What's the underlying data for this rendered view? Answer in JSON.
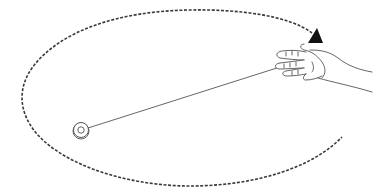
{
  "diagram": {
    "colors": {
      "background": "#ffffff",
      "stroke": "#444444",
      "orbit": "#3a3a3a",
      "arrow": "#111111"
    },
    "elements": {
      "orbit_path": "dashed-elliptical-path",
      "direction_arrow": "triangle-arrow",
      "string": "yoyo-string",
      "yoyo": "yoyo",
      "hand": "hand"
    }
  }
}
